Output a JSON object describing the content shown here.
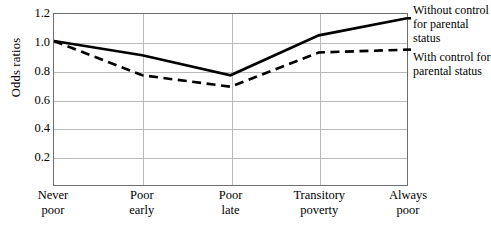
{
  "chart_data": {
    "type": "line",
    "title": "",
    "xlabel": "",
    "ylabel": "Odds ratios",
    "categories": [
      "Never poor",
      "Poor early",
      "Poor late",
      "Transitory poverty",
      "Always poor"
    ],
    "category_lines": [
      [
        "Never",
        "poor"
      ],
      [
        "Poor",
        "early"
      ],
      [
        "Poor",
        "late"
      ],
      [
        "Transitory",
        "poverty"
      ],
      [
        "Always",
        "poor"
      ]
    ],
    "series": [
      {
        "name": "Without control for parental status",
        "style": "solid",
        "color": "#000000",
        "values": [
          1.01,
          0.91,
          0.77,
          1.05,
          1.17
        ]
      },
      {
        "name": "With control for parental status",
        "style": "dashed",
        "color": "#000000",
        "values": [
          1.01,
          0.77,
          0.69,
          0.93,
          0.95
        ]
      }
    ],
    "ylim": [
      0,
      1.2
    ],
    "yticks": [
      0.2,
      0.4,
      0.6,
      0.8,
      1.0,
      1.2
    ],
    "ytick_labels": [
      "0.2",
      "0.4",
      "0.6",
      "0.8",
      "1.0",
      "1.2"
    ],
    "grid": "horizontal-and-vertical",
    "legend_position": "right-inline"
  },
  "legend": {
    "without": {
      "line1": "Without",
      "line2": "control for",
      "line3": "parental status"
    },
    "with": {
      "line1": "With control",
      "line2": "for parental",
      "line3": "status"
    }
  }
}
